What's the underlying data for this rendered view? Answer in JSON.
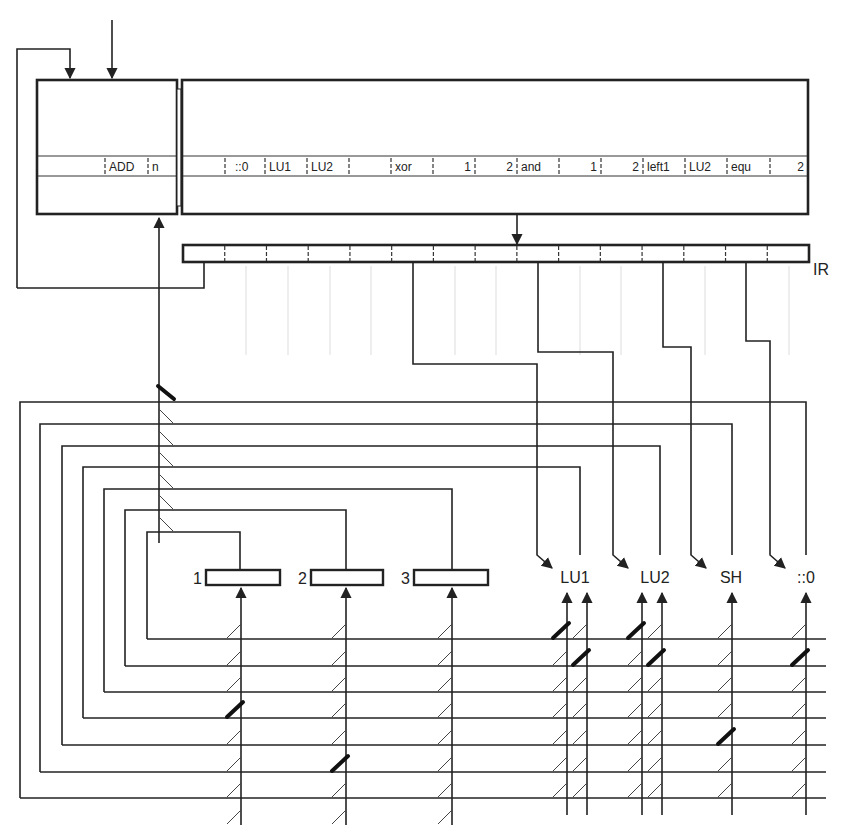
{
  "diagram": {
    "left_memory": {
      "row_cells": [
        "",
        "ADD",
        "n"
      ]
    },
    "right_memory": {
      "row_cells": [
        "",
        "::0",
        "LU1",
        "LU2",
        "",
        "xor",
        "1",
        "2",
        "and",
        "1",
        "2",
        "left1",
        "LU2",
        "equ",
        "2"
      ]
    },
    "ir_register": {
      "label": "IR",
      "cell_count": 15
    },
    "registers": [
      {
        "label": "1"
      },
      {
        "label": "2"
      },
      {
        "label": "3"
      }
    ],
    "function_units": [
      {
        "label": "LU1"
      },
      {
        "label": "LU2"
      },
      {
        "label": "SH"
      },
      {
        "label": "::0"
      }
    ],
    "bus_count": 7,
    "colors": {
      "line": "#222222",
      "background": "#ffffff"
    }
  }
}
